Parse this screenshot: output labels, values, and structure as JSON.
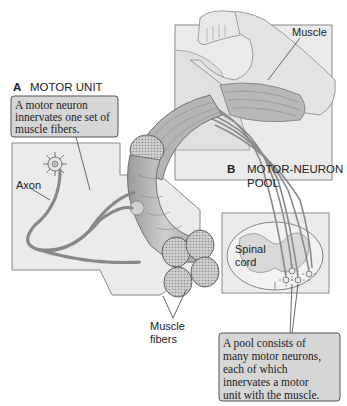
{
  "figure": {
    "panel_a": {
      "letter": "A",
      "title": "MOTOR UNIT",
      "callout_lines": [
        "A motor neuron",
        "innervates one set of",
        "muscle fibers."
      ],
      "labels": {
        "axon": "Axon",
        "muscle_fibers_line1": "Muscle",
        "muscle_fibers_line2": "fibers"
      }
    },
    "panel_b": {
      "letter": "B",
      "title_line1": "MOTOR-NEURON",
      "title_line2": "POOL",
      "labels": {
        "spinal_cord_line1": "Spinal",
        "spinal_cord_line2": "cord"
      },
      "callout_lines": [
        "A pool consists of",
        "many motor neurons,",
        "each of which",
        "innervates a motor",
        "unit with the muscle."
      ]
    },
    "arm": {
      "label": "Muscle"
    },
    "colors": {
      "panel_fill": "#ebebeb",
      "callout_fill": "#d6d6d6",
      "muscle_fill": "#b8b8b8",
      "skin_fill": "#e2e2e2",
      "outline": "#555555"
    }
  }
}
